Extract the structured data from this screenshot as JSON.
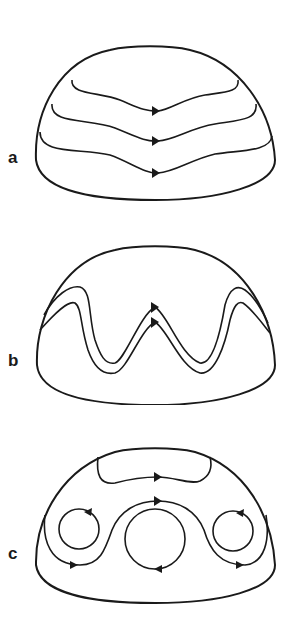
{
  "figure": {
    "panels": [
      {
        "label": "a",
        "description": "Three wavy parallel zonal flow lines with eastward arrows"
      },
      {
        "label": "b",
        "description": "Large-amplitude meandering double-line flow band with arrows at crest"
      },
      {
        "label": "c",
        "description": "Cut-off flow with closed circulation cells and meandering stream"
      }
    ]
  },
  "colors": {
    "stroke": "#1a1a1a",
    "background": "#ffffff"
  }
}
